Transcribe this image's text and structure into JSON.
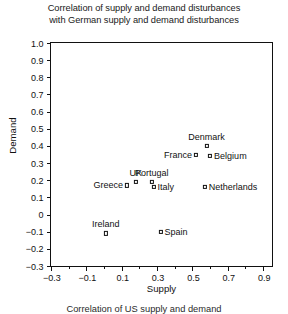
{
  "chart_data": {
    "type": "scatter",
    "title": "Correlation of supply and demand disturbances with German supply and demand disturbances",
    "title_lines": [
      "Correlation of supply and demand disturbances",
      "with German supply and demand disturbances"
    ],
    "xlabel": "Supply",
    "ylabel": "Demand",
    "xlim": [
      -0.3,
      0.95
    ],
    "ylim": [
      -0.3,
      1.0
    ],
    "grid": false,
    "legend": "none",
    "xticks": [
      -0.3,
      -0.1,
      0.1,
      0.3,
      0.5,
      0.7,
      0.9
    ],
    "xtick_labels": [
      "-0.3",
      "-0.1",
      "0.1",
      "0.3",
      "0.5",
      "0.7",
      "0.9"
    ],
    "xticks_minor": [
      -0.2,
      0.0,
      0.2,
      0.4,
      0.6,
      0.8
    ],
    "yticks": [
      -0.3,
      -0.2,
      -0.1,
      0,
      0.1,
      0.2,
      0.3,
      0.4,
      0.5,
      0.6,
      0.7,
      0.8,
      0.9,
      1.0
    ],
    "ytick_labels": [
      "-0.3",
      "-0.2",
      "-0.1",
      "0",
      "0.1",
      "0.2",
      "0.3",
      "0.4",
      "0.5",
      "0.6",
      "0.7",
      "0.8",
      "0.9",
      "1.0"
    ],
    "points": [
      {
        "label": "Denmark",
        "x": 0.58,
        "y": 0.4,
        "label_pos": "above"
      },
      {
        "label": "Belgium",
        "x": 0.6,
        "y": 0.34,
        "label_pos": "right"
      },
      {
        "label": "France",
        "x": 0.52,
        "y": 0.35,
        "label_pos": "left"
      },
      {
        "label": "Netherlands",
        "x": 0.57,
        "y": 0.16,
        "label_pos": "right"
      },
      {
        "label": "Portugal",
        "x": 0.27,
        "y": 0.19,
        "label_pos": "above"
      },
      {
        "label": "Italy",
        "x": 0.28,
        "y": 0.16,
        "label_pos": "right"
      },
      {
        "label": "UK",
        "x": 0.18,
        "y": 0.19,
        "label_pos": "above"
      },
      {
        "label": "Greece",
        "x": 0.13,
        "y": 0.17,
        "label_pos": "left"
      },
      {
        "label": "Spain",
        "x": 0.32,
        "y": -0.1,
        "label_pos": "right"
      },
      {
        "label": "Ireland",
        "x": 0.01,
        "y": -0.11,
        "label_pos": "above"
      }
    ],
    "marker_color": "#111111",
    "marker_style": "open-square",
    "axis_color": "#111111"
  },
  "bottom_caption": "Correlation of US supply and demand"
}
